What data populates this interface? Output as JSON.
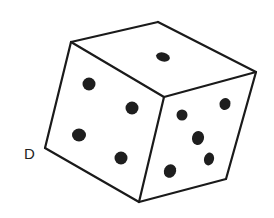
{
  "figure": {
    "stroke_color": "#1a1a1a",
    "pip_color": "#1e1e1e",
    "background": "#ffffff"
  },
  "vertex_label": {
    "text": "D",
    "x": 30,
    "y": 159
  },
  "vertices": {
    "top_left": [
      71,
      42
    ],
    "top_back": [
      158,
      22
    ],
    "top_right": [
      256,
      72
    ],
    "front_top": [
      164,
      97
    ],
    "bottom_left": [
      45,
      148
    ],
    "bottom_front": [
      139,
      202
    ],
    "bottom_right": [
      226,
      179
    ]
  },
  "faces": {
    "top": {
      "pip_count": 1,
      "pips": [
        {
          "cx": 163,
          "cy": 57,
          "rx": 7,
          "ry": 4.5,
          "rot": 15
        }
      ]
    },
    "left": {
      "pip_count": 4,
      "pips": [
        {
          "cx": 89,
          "cy": 84,
          "rx": 6.5,
          "ry": 6.5,
          "rot": 0
        },
        {
          "cx": 132,
          "cy": 108,
          "rx": 6.5,
          "ry": 6.5,
          "rot": 0
        },
        {
          "cx": 79,
          "cy": 135,
          "rx": 7,
          "ry": 6.5,
          "rot": 0
        },
        {
          "cx": 121,
          "cy": 158,
          "rx": 6.5,
          "ry": 6.5,
          "rot": 0
        }
      ]
    },
    "right": {
      "pip_count": 5,
      "pips": [
        {
          "cx": 182,
          "cy": 115,
          "rx": 5.5,
          "ry": 5.5,
          "rot": 0
        },
        {
          "cx": 225,
          "cy": 104,
          "rx": 5.5,
          "ry": 6,
          "rot": 20
        },
        {
          "cx": 198,
          "cy": 138,
          "rx": 6,
          "ry": 7,
          "rot": 15
        },
        {
          "cx": 209,
          "cy": 159,
          "rx": 5,
          "ry": 6.5,
          "rot": 15
        },
        {
          "cx": 170,
          "cy": 171,
          "rx": 6,
          "ry": 7,
          "rot": 25
        }
      ]
    }
  }
}
